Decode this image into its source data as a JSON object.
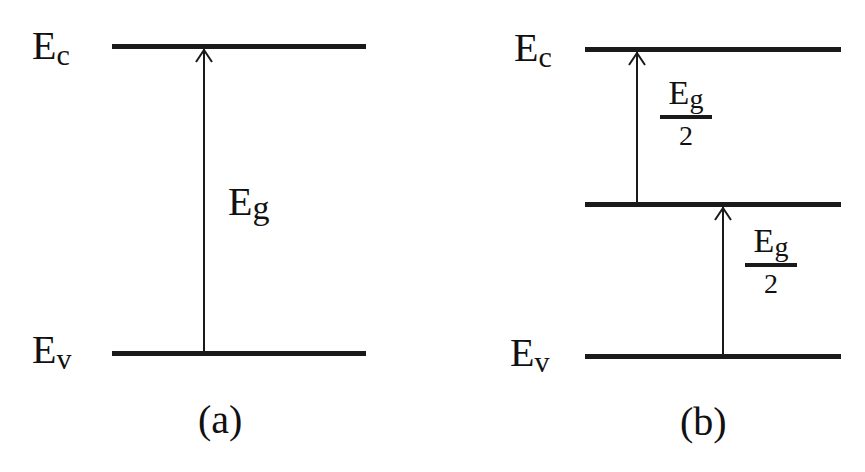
{
  "panels": [
    {
      "id": "a",
      "caption": "(a)",
      "levels": {
        "conduction": {
          "label_main": "E",
          "label_sub": "c"
        },
        "valence": {
          "label_main": "E",
          "label_sub": "v"
        }
      },
      "transitions": [
        {
          "from": "valence",
          "to": "conduction",
          "label_main": "E",
          "label_sub": "g"
        }
      ]
    },
    {
      "id": "b",
      "caption": "(b)",
      "levels": {
        "conduction": {
          "label_main": "E",
          "label_sub": "c"
        },
        "midgap": {
          "label_main": "",
          "label_sub": ""
        },
        "valence": {
          "label_main": "E",
          "label_sub": "v"
        }
      },
      "transitions": [
        {
          "from": "midgap",
          "to": "conduction",
          "label_main": "E",
          "label_sub": "g",
          "denominator": "2"
        },
        {
          "from": "valence",
          "to": "midgap",
          "label_main": "E",
          "label_sub": "g",
          "denominator": "2"
        }
      ]
    }
  ],
  "colors": {
    "line": "#1a1a1a",
    "background": "#ffffff"
  }
}
